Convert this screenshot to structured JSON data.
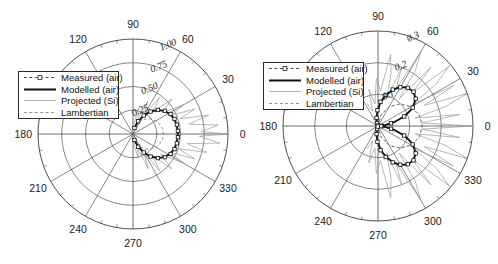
{
  "figure": {
    "background": "#ffffff",
    "panel_count": 2
  },
  "legend": {
    "entries": [
      {
        "label": "Measured (air)",
        "style": "dashed-line-with-square-marker",
        "color": "#222222"
      },
      {
        "label": "Modelled (air)",
        "style": "thick-solid-line",
        "color": "#111111"
      },
      {
        "label": "Projected (Si)",
        "style": "thin-solid-line",
        "color": "#9a9a9a"
      },
      {
        "label": "Lambertian",
        "style": "fine-dashed-line",
        "color": "#777777"
      }
    ]
  },
  "chart_data": [
    {
      "type": "line",
      "plot_kind": "polar",
      "panel": "left",
      "title": "",
      "xlabel": "",
      "ylabel": "",
      "angular_unit": "degrees",
      "angular_ticks": [
        0,
        30,
        60,
        90,
        120,
        150,
        180,
        210,
        240,
        270,
        300,
        330
      ],
      "angular_tick_labels": [
        "0",
        "30",
        "60",
        "90",
        "120",
        "",
        "180",
        "210",
        "240",
        "270",
        "300",
        "330"
      ],
      "angular_minor_step": 10,
      "radial_ticks": [
        0.25,
        0.5,
        0.75,
        1.0
      ],
      "radial_tick_labels": [
        "0.25",
        "0.50",
        "0.75",
        "1.00"
      ],
      "radial_tick_label_angle": 67,
      "rlim": [
        0,
        1.0
      ],
      "grid": true,
      "legend_position": "upper-left-inside",
      "series": [
        {
          "name": "Modelled (air)",
          "comment": "Smooth forward-directed single lobe centred on 0 deg, peak 0.47",
          "theta": [
            -78,
            -72,
            -66,
            -60,
            -54,
            -48,
            -42,
            -36,
            -30,
            -24,
            -18,
            -12,
            -6,
            0,
            6,
            12,
            18,
            24,
            30,
            36,
            42,
            48,
            54,
            60,
            66,
            72,
            78
          ],
          "r": [
            0.05,
            0.1,
            0.16,
            0.22,
            0.28,
            0.33,
            0.375,
            0.41,
            0.435,
            0.452,
            0.463,
            0.469,
            0.471,
            0.472,
            0.471,
            0.469,
            0.463,
            0.452,
            0.435,
            0.41,
            0.375,
            0.33,
            0.28,
            0.22,
            0.16,
            0.1,
            0.05
          ]
        },
        {
          "name": "Measured (air)",
          "comment": "Markered trace closely following the modelled lobe",
          "theta": [
            -76,
            -68,
            -60,
            -52,
            -44,
            -36,
            -28,
            -20,
            -12,
            -4,
            4,
            12,
            20,
            28,
            36,
            44,
            52,
            60,
            68,
            76
          ],
          "r": [
            0.065,
            0.145,
            0.225,
            0.3,
            0.365,
            0.415,
            0.448,
            0.465,
            0.472,
            0.474,
            0.474,
            0.472,
            0.465,
            0.448,
            0.415,
            0.365,
            0.3,
            0.225,
            0.145,
            0.065
          ]
        },
        {
          "name": "Lambertian",
          "comment": "Cosine lobe, peak 0.32 at 0 deg",
          "theta": [
            -90,
            -80,
            -70,
            -60,
            -50,
            -40,
            -30,
            -20,
            -10,
            0,
            10,
            20,
            30,
            40,
            50,
            60,
            70,
            80,
            90
          ],
          "r": [
            0.0,
            0.056,
            0.109,
            0.16,
            0.206,
            0.245,
            0.277,
            0.301,
            0.315,
            0.32,
            0.315,
            0.301,
            0.277,
            0.245,
            0.206,
            0.16,
            0.109,
            0.056,
            0.0
          ]
        },
        {
          "name": "Projected (Si)",
          "comment": "Noisy broad pattern extending to the outer ring near 0 deg with spiky side structure",
          "theta": [
            -90,
            -84,
            -78,
            -72,
            -66,
            -60,
            -54,
            -48,
            -42,
            -36,
            -30,
            -26,
            -22,
            -18,
            -14,
            -10,
            -6,
            -2,
            0,
            2,
            6,
            10,
            14,
            18,
            22,
            26,
            30,
            36,
            42,
            48,
            54,
            60,
            66,
            72,
            78,
            84,
            90
          ],
          "r": [
            0.04,
            0.11,
            0.26,
            0.17,
            0.4,
            0.22,
            0.48,
            0.3,
            0.55,
            0.36,
            0.62,
            0.44,
            0.7,
            0.5,
            0.8,
            0.58,
            0.92,
            0.7,
            1.0,
            0.72,
            0.9,
            0.6,
            0.82,
            0.52,
            0.7,
            0.45,
            0.62,
            0.38,
            0.55,
            0.31,
            0.47,
            0.24,
            0.38,
            0.17,
            0.28,
            0.11,
            0.05
          ]
        }
      ]
    },
    {
      "type": "line",
      "plot_kind": "polar",
      "panel": "right",
      "title": "",
      "xlabel": "",
      "ylabel": "",
      "angular_unit": "degrees",
      "angular_ticks": [
        0,
        30,
        60,
        90,
        120,
        150,
        180,
        210,
        240,
        270,
        300,
        330
      ],
      "angular_tick_labels": [
        "0",
        "30",
        "60",
        "90",
        "120",
        "",
        "180",
        "210",
        "240",
        "270",
        "300",
        "330"
      ],
      "angular_minor_step": 10,
      "radial_ticks": [
        0.1,
        0.2,
        0.3
      ],
      "radial_tick_labels": [
        "0.1",
        "0.2",
        "0.3"
      ],
      "radial_tick_label_angle": 67,
      "rlim": [
        0,
        0.3
      ],
      "grid": true,
      "legend_position": "upper-left-inside",
      "series": [
        {
          "name": "Modelled (air)",
          "comment": "Two-lobed butterfly pattern with null at 0 deg, peaks near +/-45 deg at 0.155",
          "theta": [
            2,
            8,
            14,
            20,
            26,
            32,
            38,
            44,
            50,
            56,
            62,
            68,
            74,
            80,
            86,
            92,
            98,
            104,
            110,
            116,
            120,
            116,
            110,
            104,
            98,
            92,
            86,
            80,
            74,
            68,
            62,
            56,
            50,
            44,
            38,
            32,
            26,
            20,
            14,
            8,
            2
          ],
          "r": [
            0.004,
            0.025,
            0.055,
            0.088,
            0.116,
            0.136,
            0.149,
            0.155,
            0.154,
            0.148,
            0.137,
            0.122,
            0.105,
            0.086,
            0.066,
            0.046,
            0.03,
            0.017,
            0.008,
            0.002,
            0.0,
            0.002,
            0.008,
            0.017,
            0.03,
            0.046,
            0.066,
            0.086,
            0.105,
            0.122,
            0.137,
            0.148,
            0.154,
            0.155,
            0.149,
            0.136,
            0.116,
            0.088,
            0.055,
            0.025,
            0.004
          ]
        },
        {
          "name": "Measured (air)",
          "comment": "Markered trace on both lobes, mirrored above and below the 0-180 axis",
          "theta": [
            4,
            12,
            20,
            28,
            36,
            44,
            52,
            60,
            68,
            76,
            84,
            92,
            100,
            108,
            116
          ],
          "r": [
            0.01,
            0.042,
            0.088,
            0.124,
            0.147,
            0.156,
            0.153,
            0.141,
            0.124,
            0.101,
            0.077,
            0.05,
            0.026,
            0.01,
            0.002
          ]
        },
        {
          "name": "Lambertian",
          "comment": "Faint dashed reference lobe",
          "theta": [
            -90,
            -75,
            -60,
            -45,
            -30,
            -15,
            0,
            15,
            30,
            45,
            60,
            75,
            90
          ],
          "r": [
            0.0,
            0.036,
            0.07,
            0.099,
            0.121,
            0.135,
            0.14,
            0.135,
            0.121,
            0.099,
            0.07,
            0.036,
            0.0
          ]
        },
        {
          "name": "Projected (Si)",
          "comment": "Noisy spiky pattern reaching the outer ring, strongest between 10 and 60 deg",
          "theta": [
            0,
            4,
            8,
            12,
            16,
            20,
            24,
            28,
            32,
            36,
            40,
            44,
            48,
            52,
            56,
            60,
            64,
            68,
            72,
            76,
            80,
            86,
            92,
            98,
            104,
            110,
            116
          ],
          "r": [
            0.3,
            0.14,
            0.26,
            0.12,
            0.22,
            0.3,
            0.16,
            0.27,
            0.13,
            0.23,
            0.29,
            0.15,
            0.25,
            0.11,
            0.21,
            0.27,
            0.13,
            0.2,
            0.09,
            0.17,
            0.23,
            0.11,
            0.15,
            0.07,
            0.12,
            0.05,
            0.08
          ]
        }
      ]
    }
  ]
}
